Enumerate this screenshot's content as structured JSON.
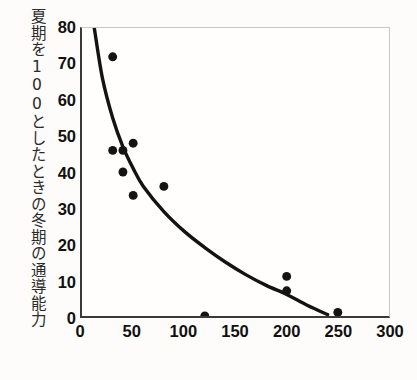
{
  "chart_data": {
    "type": "scatter",
    "title": "",
    "subtitle": "",
    "xlabel": "",
    "ylabel": "夏期を100としたときの冬期の通導能力",
    "xlim": [
      0,
      300
    ],
    "ylim": [
      0,
      80
    ],
    "xticks": [
      0,
      50,
      100,
      150,
      200,
      250,
      300
    ],
    "yticks": [
      0,
      10,
      20,
      30,
      40,
      50,
      60,
      70,
      80
    ],
    "xtick_labels": [
      "0",
      "50",
      "100",
      "150",
      "200",
      "250",
      "300"
    ],
    "ytick_labels": [
      "0",
      "10",
      "20",
      "30",
      "40",
      "50",
      "60",
      "70",
      "80"
    ],
    "grid": false,
    "legend": null,
    "marker": {
      "shape": "circle",
      "color": "#141414",
      "size": 9
    },
    "points": [
      {
        "x": 30,
        "y": 72
      },
      {
        "x": 30,
        "y": 46
      },
      {
        "x": 40,
        "y": 46
      },
      {
        "x": 50,
        "y": 48
      },
      {
        "x": 40,
        "y": 40
      },
      {
        "x": 50,
        "y": 33.5
      },
      {
        "x": 80,
        "y": 36
      },
      {
        "x": 120,
        "y": 0
      },
      {
        "x": 200,
        "y": 11
      },
      {
        "x": 200,
        "y": 7
      },
      {
        "x": 250,
        "y": 1
      }
    ],
    "fit_curve": {
      "name": "exponential-decay-fit",
      "color": "#131313",
      "points": [
        {
          "x": 12,
          "y": 80
        },
        {
          "x": 20,
          "y": 66
        },
        {
          "x": 30,
          "y": 55
        },
        {
          "x": 40,
          "y": 47
        },
        {
          "x": 50,
          "y": 41
        },
        {
          "x": 60,
          "y": 36
        },
        {
          "x": 80,
          "y": 29
        },
        {
          "x": 100,
          "y": 23.5
        },
        {
          "x": 120,
          "y": 19
        },
        {
          "x": 140,
          "y": 15
        },
        {
          "x": 160,
          "y": 11.5
        },
        {
          "x": 180,
          "y": 8.5
        },
        {
          "x": 200,
          "y": 6
        },
        {
          "x": 220,
          "y": 3
        },
        {
          "x": 240,
          "y": 0.4
        }
      ]
    }
  },
  "axes": {
    "ylabel_text": "夏期を100としたときの冬期の通導能力"
  }
}
